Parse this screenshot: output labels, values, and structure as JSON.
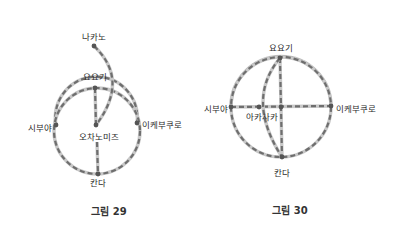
{
  "figures": [
    {
      "caption": "그림 29",
      "stations": {
        "nakano": "나카노",
        "yoyogi": "요요기",
        "ochanomizu": "오차노미즈",
        "shibuya": "시부야",
        "ikebukuro": "이케부쿠로",
        "kanda": "칸다"
      }
    },
    {
      "caption": "그림 30",
      "stations": {
        "yoyogi": "요요기",
        "shibuya": "시부야",
        "akasaka": "아카사카",
        "ikebukuro": "이케부쿠로",
        "kanda": "칸다"
      }
    }
  ],
  "colors": {
    "line_dash": "#6e6e6e",
    "line_under": "#c8c8c8",
    "node": "#555555",
    "text": "#2a2a2a",
    "background": "#ffffff"
  }
}
